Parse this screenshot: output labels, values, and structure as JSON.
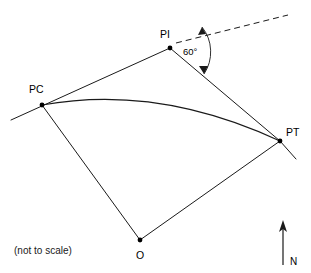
{
  "figure": {
    "type": "horizontal-curve-geometry-diagram",
    "note": "(not to scale)",
    "background_color": "#ffffff",
    "line_color": "#1a1a1a"
  },
  "points": {
    "pc": {
      "label": "PC",
      "x": 42,
      "y": 105,
      "label_x": 29,
      "label_y": 93
    },
    "pi": {
      "label": "PI",
      "x": 170,
      "y": 48,
      "label_x": 160,
      "label_y": 38
    },
    "pt": {
      "label": "PT",
      "x": 280,
      "y": 141,
      "label_x": 286,
      "label_y": 136
    },
    "o": {
      "label": "O",
      "x": 140,
      "y": 240,
      "label_x": 136,
      "label_y": 259
    }
  },
  "angle": {
    "label": "60°",
    "value": 60,
    "unit": "degrees",
    "label_x": 183,
    "label_y": 55,
    "vertex": "PI"
  },
  "compass": {
    "label": "N",
    "label_x": 290,
    "label_y": 265,
    "arrow_x": 283,
    "arrow_top_y": 221,
    "arrow_bottom_y": 265
  },
  "segments": [
    {
      "name": "back-tangent-through-pc",
      "from": "tangent-start",
      "to": "PI"
    },
    {
      "name": "forward-tangent-pi-to-pt",
      "from": "PI",
      "to": "PT"
    },
    {
      "name": "radius-pc-to-o",
      "from": "PC",
      "to": "O"
    },
    {
      "name": "radius-o-to-pt",
      "from": "O",
      "to": "PT"
    },
    {
      "name": "tangent-extension-beyond-pt",
      "from": "PT",
      "to": "tangent-end"
    },
    {
      "name": "tangent-extension-dashed",
      "from": "PI",
      "to": "dashed-end",
      "style": "dashed"
    },
    {
      "name": "circular-curve-pc-to-pt",
      "from": "PC",
      "to": "PT",
      "style": "arc"
    }
  ]
}
